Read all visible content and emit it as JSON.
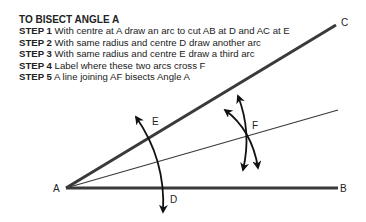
{
  "instructions": {
    "title": "TO BISECT ANGLE A",
    "steps": [
      {
        "label": "STEP 1",
        "text": " With centre at A draw an arc to cut AB at D and AC at E"
      },
      {
        "label": "STEP 2",
        "text": " With same radius and centre D draw another arc"
      },
      {
        "label": "STEP 3",
        "text": " With same radius and centre E draw a third arc"
      },
      {
        "label": "STEP 4",
        "text": " Label where these two arcs cross F"
      },
      {
        "label": "STEP 5",
        "text": " A line joining AF bisects Angle A"
      }
    ]
  },
  "diagram": {
    "points": {
      "A": "A",
      "B": "B",
      "C": "C",
      "D": "D",
      "E": "E",
      "F": "F"
    },
    "colors": {
      "line": "#3a3a3a",
      "arc": "#111111",
      "text": "#222222"
    }
  }
}
